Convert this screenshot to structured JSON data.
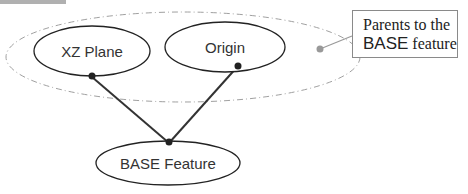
{
  "diagram": {
    "nodes": [
      {
        "id": "xz-plane",
        "label": "XZ Plane"
      },
      {
        "id": "origin",
        "label": "Origin"
      },
      {
        "id": "base-feature",
        "label": "BASE Feature"
      }
    ],
    "edges": [
      {
        "from": "xz-plane",
        "to": "base-feature"
      },
      {
        "from": "origin",
        "to": "base-feature"
      }
    ],
    "group": {
      "members": [
        "xz-plane",
        "origin"
      ],
      "style": "dash-dot ellipse"
    },
    "callout": {
      "line1": "Parents to the",
      "line2_bold": "BASE",
      "line2_rest": " feature"
    }
  },
  "colors": {
    "node_stroke": "#222222",
    "group_stroke": "#9a9a9a",
    "callout_border": "#8a8a8a",
    "top_bar": "#b0b0b0"
  }
}
